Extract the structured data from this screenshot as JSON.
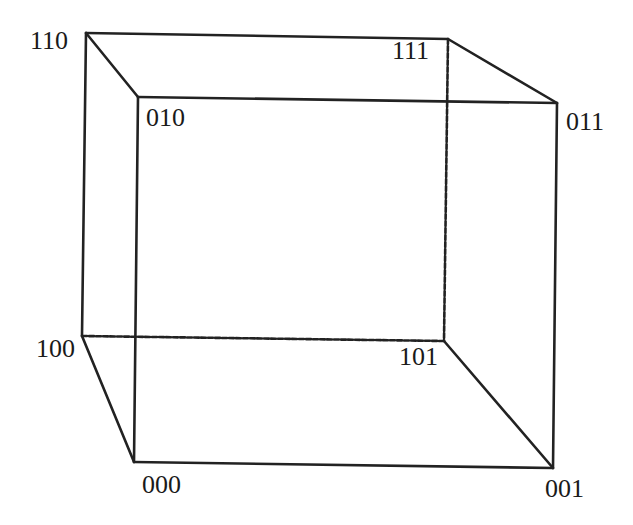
{
  "diagram": {
    "type": "binary-cube",
    "vertices": [
      {
        "id": "110",
        "label": "110",
        "x": 86,
        "y": 33,
        "lx": 30,
        "ly": 36
      },
      {
        "id": "111",
        "label": "111",
        "x": 448,
        "y": 39,
        "lx": 392,
        "ly": 46
      },
      {
        "id": "010",
        "label": "010",
        "x": 138,
        "y": 97,
        "lx": 146,
        "ly": 113
      },
      {
        "id": "011",
        "label": "011",
        "x": 557,
        "y": 103,
        "lx": 566,
        "ly": 117
      },
      {
        "id": "100",
        "label": "100",
        "x": 82,
        "y": 336,
        "lx": 36,
        "ly": 344
      },
      {
        "id": "101",
        "label": "101",
        "x": 444,
        "y": 341,
        "lx": 399,
        "ly": 352
      },
      {
        "id": "000",
        "label": "000",
        "x": 134,
        "y": 462,
        "lx": 142,
        "ly": 480
      },
      {
        "id": "001",
        "label": "001",
        "x": 553,
        "y": 468,
        "lx": 545,
        "ly": 484
      }
    ],
    "edges": [
      {
        "from": "110",
        "to": "111",
        "style": "solid"
      },
      {
        "from": "110",
        "to": "010",
        "style": "solid"
      },
      {
        "from": "111",
        "to": "011",
        "style": "solid"
      },
      {
        "from": "010",
        "to": "011",
        "style": "solid"
      },
      {
        "from": "110",
        "to": "100",
        "style": "solid"
      },
      {
        "from": "010",
        "to": "000",
        "style": "solid"
      },
      {
        "from": "011",
        "to": "001",
        "style": "solid"
      },
      {
        "from": "111",
        "to": "101",
        "style": "dashed"
      },
      {
        "from": "100",
        "to": "101",
        "style": "dashed"
      },
      {
        "from": "100",
        "to": "000",
        "style": "solid"
      },
      {
        "from": "101",
        "to": "001",
        "style": "solid"
      },
      {
        "from": "000",
        "to": "001",
        "style": "solid"
      }
    ],
    "colors": {
      "line": "#222222",
      "text": "#1a1a1a",
      "background": "#ffffff"
    }
  }
}
